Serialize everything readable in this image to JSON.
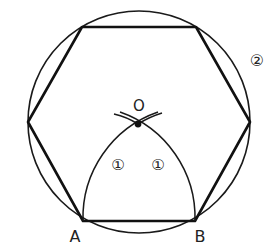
{
  "diagram": {
    "circle": {
      "cx": 139,
      "cy": 122,
      "r": 111,
      "color": "#1a1a1a"
    },
    "hexagon": {
      "points": "82,27 196,27 250,122 195,221 83,221 28,122",
      "color": "#111111"
    },
    "center_point": {
      "x": 138,
      "y": 124,
      "label": "O"
    },
    "vertices": {
      "A": {
        "x": 83,
        "y": 221,
        "label": "A"
      },
      "B": {
        "x": 195,
        "y": 221,
        "label": "B"
      }
    },
    "step_labels": {
      "arc_left": "①",
      "arc_right": "①",
      "circle": "②"
    }
  }
}
